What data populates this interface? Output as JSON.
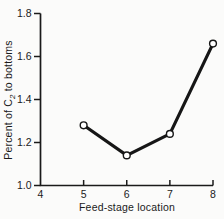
{
  "chart_data": {
    "type": "line",
    "title": "",
    "x": [
      5,
      6,
      7,
      8
    ],
    "values": [
      1.28,
      1.14,
      1.24,
      1.66
    ],
    "xlabel": "Feed-stage location",
    "ylabel": "Percent of C2 to bottoms",
    "ylabel_parts": {
      "pre": "Percent of C",
      "sub": "2",
      "post": " to bottoms"
    },
    "xlim": [
      4,
      8
    ],
    "ylim": [
      1.0,
      1.8
    ],
    "x_ticks": [
      4,
      5,
      6,
      7,
      8
    ],
    "x_tick_labels": [
      "4",
      "5",
      "6",
      "7",
      "8"
    ],
    "y_ticks": [
      1.0,
      1.2,
      1.4,
      1.6,
      1.8
    ],
    "y_tick_labels": [
      "1.0",
      "1.2",
      "1.4",
      "1.6",
      "1.8"
    ],
    "marker": "open-circle",
    "grid": false,
    "legend": null,
    "colors": {
      "line": "#161616",
      "axis": "#1a1a1a",
      "text": "#1a1a1a",
      "marker_fill": "#ffffff",
      "background": "#fbfbfa"
    }
  }
}
